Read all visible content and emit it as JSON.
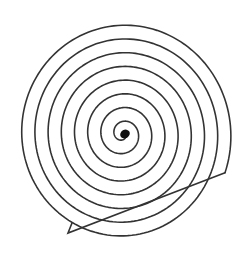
{
  "figure": {
    "background": "#ffffff",
    "stroke_color": "#333333",
    "stroke_width": 1.6,
    "dot_color": "#111111"
  },
  "spiral": {
    "center": [
      123,
      134
    ],
    "start_radius": 3,
    "pitch": 13.2,
    "turns": 8.0,
    "start_angle_deg": 20,
    "end_cap": [
      [
        68,
        233
      ],
      [
        72,
        223
      ]
    ],
    "center_dot": {
      "cx": 125,
      "cy": 134,
      "rx": 5,
      "ry": 4.2
    }
  }
}
